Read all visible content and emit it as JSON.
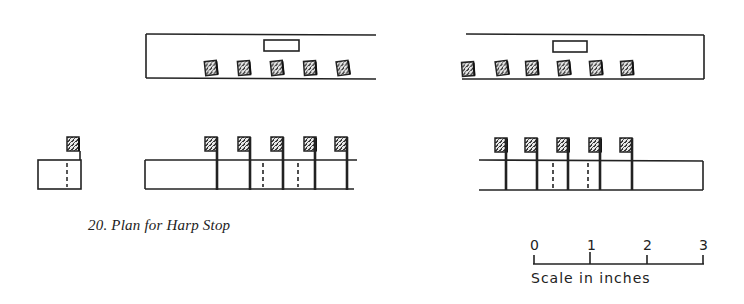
{
  "caption": "20. Plan for Harp Stop",
  "scale": {
    "ticks": [
      "0",
      "1",
      "2",
      "3"
    ],
    "label": "Scale in inches"
  },
  "figures": {
    "upper_left": {
      "block_count": 5
    },
    "upper_right": {
      "block_count": 6
    },
    "lower_small": {
      "block_count": 1
    },
    "lower_left": {
      "block_count": 5
    },
    "lower_right": {
      "block_count": 5
    }
  },
  "colors": {
    "ink": "#222222",
    "paper": "#ffffff"
  }
}
